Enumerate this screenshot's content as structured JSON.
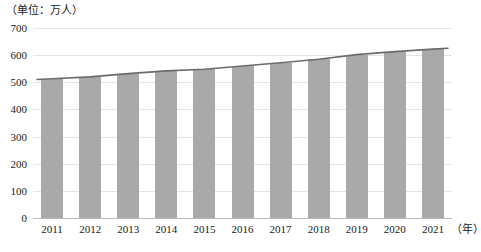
{
  "chart_data": {
    "type": "bar",
    "title": "",
    "subtitle": "",
    "unit_caption": "（单位：万人）",
    "xlabel": "（年）",
    "ylabel": "",
    "categories": [
      "2011",
      "2012",
      "2013",
      "2014",
      "2015",
      "2016",
      "2017",
      "2018",
      "2019",
      "2020",
      "2021"
    ],
    "values": [
      513,
      520,
      532,
      542,
      548,
      560,
      572,
      585,
      602,
      613,
      622
    ],
    "series": [
      {
        "name": "人数",
        "type": "bar",
        "values": [
          513,
          520,
          532,
          542,
          548,
          560,
          572,
          585,
          602,
          613,
          622
        ]
      },
      {
        "name": "趋势线",
        "type": "line",
        "values": [
          513,
          520,
          532,
          542,
          548,
          560,
          572,
          585,
          602,
          613,
          622
        ]
      }
    ],
    "ylim": [
      0,
      700
    ],
    "ytick_values": [
      0,
      100,
      200,
      300,
      400,
      500,
      600,
      700
    ],
    "ytick_labels": [
      "0",
      "100",
      "200",
      "300",
      "400",
      "500",
      "600",
      "700"
    ],
    "grid": true,
    "legend": false,
    "legend_position": "none",
    "colors": {
      "bar": "#a9a9a9",
      "trend_line": "#6b6b6b",
      "gridline": "#e2e4e6",
      "baseline": "#b9bcbf",
      "text": "#1a1a1a",
      "background": "#ffffff"
    }
  }
}
